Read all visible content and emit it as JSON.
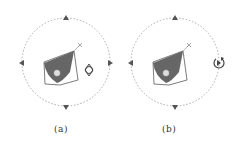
{
  "panels": [
    {
      "id": "a",
      "caption": "(a)",
      "center": [
        66,
        62
      ],
      "radius": 44,
      "side_icon": "gizmo-icon"
    },
    {
      "id": "b",
      "caption": "(b)",
      "center": [
        175,
        62
      ],
      "radius": 44,
      "side_icon": "rotate-play-icon"
    }
  ],
  "colors": {
    "ring": "#aaaaaa",
    "arrow": "#555555",
    "shape": "#666666",
    "outline": "#444444"
  }
}
